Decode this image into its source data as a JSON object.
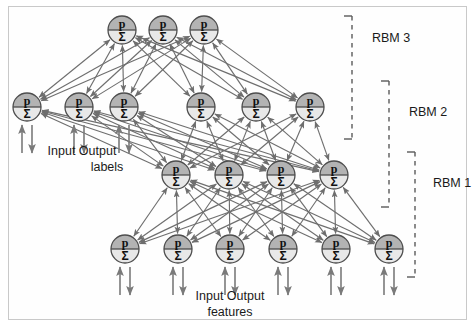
{
  "figure": {
    "background_color": "#fefefe",
    "border_color": "#c9c9c9"
  },
  "style": {
    "node_fill_top": "#b3b3b3",
    "node_fill_bottom": "#e8e8e8",
    "node_stroke": "#4d4d4d",
    "edge_color": "#6e6e6e",
    "io_arrow_color": "#7a7a7a",
    "bracket_color": "#5a5a5a"
  },
  "node_glyphs": {
    "top": "p",
    "bottom": "Σ"
  },
  "layers": [
    {
      "id": "layer-top",
      "name": "top-hidden-layer",
      "node_count": 3,
      "cy": 30,
      "r": 14,
      "xs": [
        122,
        163,
        204
      ],
      "has_io_arrows": false
    },
    {
      "id": "layer-second",
      "name": "label-and-hidden-layer",
      "node_count": 6,
      "cy": 107,
      "r": 14,
      "xs": [
        27,
        79,
        124,
        201,
        256,
        310
      ],
      "has_io_arrows": true,
      "io_arrow_indices": [
        0,
        1,
        2
      ],
      "io_label": "labels"
    },
    {
      "id": "layer-third",
      "name": "middle-hidden-layer",
      "node_count": 4,
      "cy": 175,
      "r": 14,
      "xs": [
        176,
        229,
        281,
        334
      ],
      "has_io_arrows": false
    },
    {
      "id": "layer-bottom",
      "name": "feature-visible-layer",
      "node_count": 6,
      "cy": 249,
      "r": 14,
      "xs": [
        125,
        178,
        230,
        283,
        336,
        389
      ],
      "has_io_arrows": true,
      "io_arrow_indices": [
        0,
        1,
        2,
        3,
        4,
        5
      ],
      "io_label": "features"
    }
  ],
  "connections": [
    {
      "name": "rbm3-connections",
      "from_layer": "layer-second",
      "to_layer": "layer-top",
      "bidirectional": true
    },
    {
      "name": "rbm2-connections",
      "from_layer": "layer-third",
      "to_layer": "layer-second",
      "bidirectional": true
    },
    {
      "name": "rbm1-connections",
      "from_layer": "layer-bottom",
      "to_layer": "layer-third",
      "bidirectional": true
    }
  ],
  "captions": [
    {
      "name": "labels-io-caption",
      "line1": "Input Output",
      "line2": "labels",
      "x1": 82,
      "y1": 155,
      "x2": 107,
      "y2": 171
    },
    {
      "name": "features-io-caption",
      "line1": "Input Output",
      "line2": "features",
      "x1": 230,
      "y1": 300,
      "x2": 230,
      "y2": 316
    }
  ],
  "rbm_brackets": [
    {
      "name": "rbm-3-bracket",
      "label": "RBM 3",
      "x": 352,
      "top": 16,
      "bottom": 139,
      "tick_length": 8,
      "label_x": 372,
      "label_y": 42
    },
    {
      "name": "rbm-2-bracket",
      "label": "RBM 2",
      "x": 389,
      "top": 81,
      "bottom": 207,
      "tick_length": 8,
      "label_x": 409,
      "label_y": 116
    },
    {
      "name": "rbm-1-bracket",
      "label": "RBM 1",
      "x": 415,
      "top": 152,
      "bottom": 277,
      "tick_length": 8,
      "label_x": 433,
      "label_y": 187
    }
  ]
}
